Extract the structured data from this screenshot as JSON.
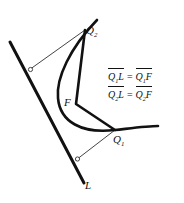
{
  "figure": {
    "type": "geometry-diagram",
    "canvas": {
      "width": 184,
      "height": 203,
      "background": "#ffffff"
    },
    "colors": {
      "stroke_thick": "#111111",
      "stroke_thin": "#4a4a4a",
      "text": "#111111"
    },
    "points": {
      "Q2": {
        "x": 85,
        "y": 30
      },
      "Q1": {
        "x": 115,
        "y": 130
      },
      "F": {
        "x": 76,
        "y": 104
      },
      "foot_Q2": {
        "x": 29,
        "y": 70
      },
      "foot_Q1": {
        "x": 76,
        "y": 160
      }
    },
    "directrix": {
      "name": "L",
      "from": {
        "x": 10,
        "y": 42
      },
      "to": {
        "x": 84,
        "y": 183
      }
    },
    "parabola_path": "M 97,20 C 70,48 56,78 58,98 C 60,122 82,134 115,130 C 133,128 148,126 158,126",
    "chord_path": "M 85,30 L 76,104 L 115,130",
    "perpendicular_Q2": {
      "from": {
        "x": 85,
        "y": 30
      },
      "to": {
        "x": 29,
        "y": 70
      }
    },
    "perpendicular_Q1": {
      "from": {
        "x": 115,
        "y": 130
      },
      "to": {
        "x": 76,
        "y": 160
      }
    }
  },
  "labels": {
    "q2": "Q",
    "q2_sub": "2",
    "q1": "Q",
    "q1_sub": "1",
    "f": "F",
    "l": "L"
  },
  "equations": {
    "line1": {
      "left": "Q",
      "left_sub": "1",
      "left_tail": "L",
      "sign": "=",
      "right": "Q",
      "right_sub": "1",
      "right_tail": "F"
    },
    "line2": {
      "left": "Q",
      "left_sub": "2",
      "left_tail": "L",
      "sign": "=",
      "right": "Q",
      "right_sub": "2",
      "right_tail": "F"
    }
  }
}
